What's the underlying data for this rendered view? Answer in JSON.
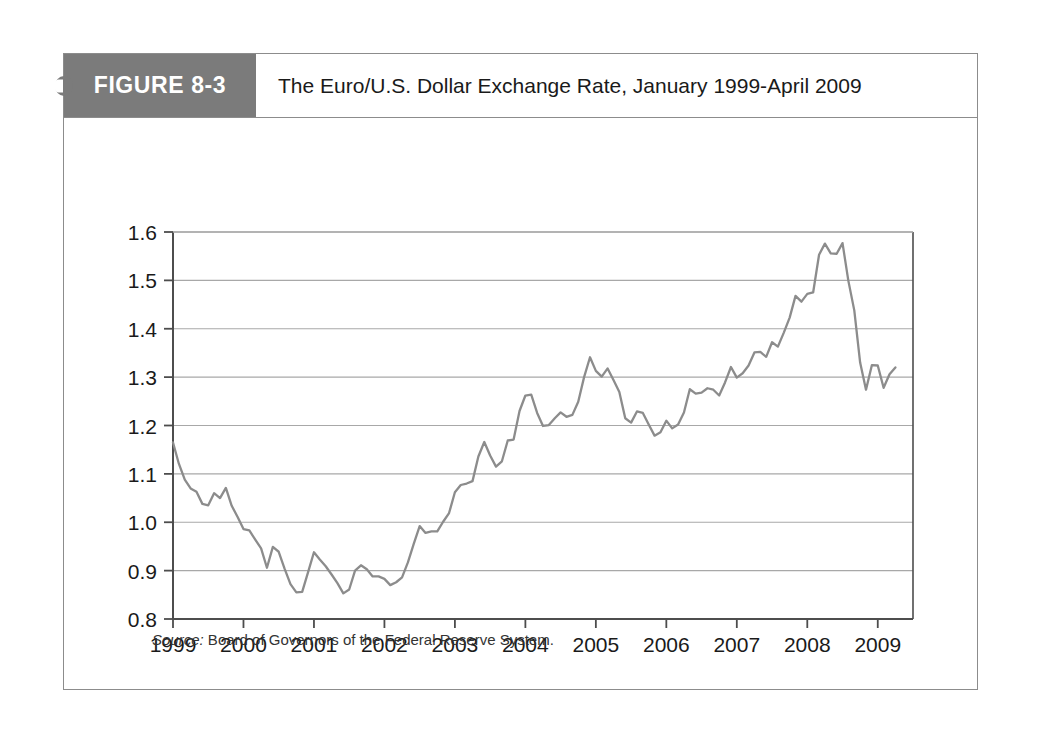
{
  "figure": {
    "number_label": "FIGURE 8-3",
    "title": "The Euro/U.S. Dollar Exchange Rate, January 1999-April 2009",
    "source_label": "Source:",
    "source_text": " Board of Governors of the Federal Reserve System."
  },
  "colors": {
    "tab_background": "#7b7b7b",
    "tab_text": "#ffffff",
    "title_text": "#1a1a1a",
    "frame_border": "#8c8c8c",
    "axis": "#4d4d4d",
    "gridline": "#a8a8a8",
    "series_line": "#8c8c8c",
    "page_background": "#ffffff"
  },
  "chart_data": {
    "type": "line",
    "title": "The Euro/U.S. Dollar Exchange Rate, January 1999-April 2009",
    "xlabel": "",
    "ylabel": "",
    "xlim": [
      1999.0,
      2009.5
    ],
    "ylim": [
      0.8,
      1.6
    ],
    "grid": true,
    "legend": "none",
    "x_ticks": [
      "1999",
      "2000",
      "2001",
      "2002",
      "2003",
      "2004",
      "2005",
      "2006",
      "2007",
      "2008",
      "2009"
    ],
    "x_tick_values": [
      1999,
      2000,
      2001,
      2002,
      2003,
      2004,
      2005,
      2006,
      2007,
      2008,
      2009
    ],
    "y_ticks": [
      "0.8",
      "0.9",
      "1.0",
      "1.1",
      "1.2",
      "1.3",
      "1.4",
      "1.5",
      "1.6"
    ],
    "y_tick_values": [
      0.8,
      0.9,
      1.0,
      1.1,
      1.2,
      1.3,
      1.4,
      1.5,
      1.6
    ],
    "series": [
      {
        "name": "Euro/U.S. Dollar Exchange Rate",
        "x": [
          1999.0,
          1999.083,
          1999.167,
          1999.25,
          1999.333,
          1999.417,
          1999.5,
          1999.583,
          1999.667,
          1999.75,
          1999.833,
          1999.917,
          2000.0,
          2000.083,
          2000.167,
          2000.25,
          2000.333,
          2000.417,
          2000.5,
          2000.583,
          2000.667,
          2000.75,
          2000.833,
          2000.917,
          2001.0,
          2001.083,
          2001.167,
          2001.25,
          2001.333,
          2001.417,
          2001.5,
          2001.583,
          2001.667,
          2001.75,
          2001.833,
          2001.917,
          2002.0,
          2002.083,
          2002.167,
          2002.25,
          2002.333,
          2002.417,
          2002.5,
          2002.583,
          2002.667,
          2002.75,
          2002.833,
          2002.917,
          2003.0,
          2003.083,
          2003.167,
          2003.25,
          2003.333,
          2003.417,
          2003.5,
          2003.583,
          2003.667,
          2003.75,
          2003.833,
          2003.917,
          2004.0,
          2004.083,
          2004.167,
          2004.25,
          2004.333,
          2004.417,
          2004.5,
          2004.583,
          2004.667,
          2004.75,
          2004.833,
          2004.917,
          2005.0,
          2005.083,
          2005.167,
          2005.25,
          2005.333,
          2005.417,
          2005.5,
          2005.583,
          2005.667,
          2005.75,
          2005.833,
          2005.917,
          2006.0,
          2006.083,
          2006.167,
          2006.25,
          2006.333,
          2006.417,
          2006.5,
          2006.583,
          2006.667,
          2006.75,
          2006.833,
          2006.917,
          2007.0,
          2007.083,
          2007.167,
          2007.25,
          2007.333,
          2007.417,
          2007.5,
          2007.583,
          2007.667,
          2007.75,
          2007.833,
          2007.917,
          2008.0,
          2008.083,
          2008.167,
          2008.25,
          2008.333,
          2008.417,
          2008.5,
          2008.583,
          2008.667,
          2008.75,
          2008.833,
          2008.917,
          2009.0,
          2009.083,
          2009.167,
          2009.25
        ],
        "values": [
          1.165,
          1.121,
          1.088,
          1.07,
          1.063,
          1.038,
          1.035,
          1.06,
          1.05,
          1.071,
          1.034,
          1.011,
          0.986,
          0.983,
          0.964,
          0.946,
          0.906,
          0.949,
          0.939,
          0.904,
          0.872,
          0.855,
          0.856,
          0.897,
          0.938,
          0.923,
          0.909,
          0.892,
          0.874,
          0.853,
          0.861,
          0.9,
          0.911,
          0.903,
          0.888,
          0.888,
          0.883,
          0.87,
          0.876,
          0.886,
          0.917,
          0.956,
          0.992,
          0.978,
          0.981,
          0.981,
          1.001,
          1.019,
          1.062,
          1.077,
          1.08,
          1.085,
          1.136,
          1.166,
          1.138,
          1.115,
          1.126,
          1.169,
          1.171,
          1.23,
          1.262,
          1.264,
          1.226,
          1.199,
          1.201,
          1.215,
          1.227,
          1.218,
          1.222,
          1.249,
          1.3,
          1.341,
          1.313,
          1.301,
          1.318,
          1.294,
          1.269,
          1.215,
          1.206,
          1.229,
          1.226,
          1.202,
          1.179,
          1.186,
          1.21,
          1.194,
          1.202,
          1.227,
          1.275,
          1.266,
          1.268,
          1.277,
          1.274,
          1.262,
          1.289,
          1.321,
          1.299,
          1.308,
          1.324,
          1.351,
          1.352,
          1.342,
          1.372,
          1.363,
          1.392,
          1.423,
          1.468,
          1.456,
          1.472,
          1.475,
          1.553,
          1.576,
          1.556,
          1.555,
          1.577,
          1.499,
          1.438,
          1.33,
          1.274,
          1.325,
          1.324,
          1.278,
          1.306,
          1.32
        ]
      }
    ]
  }
}
